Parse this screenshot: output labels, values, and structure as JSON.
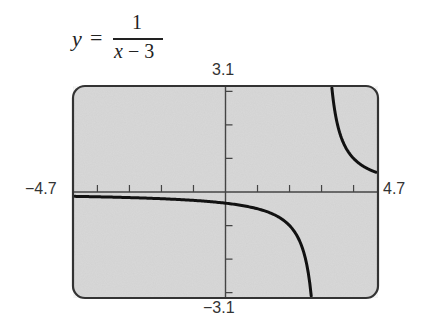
{
  "formula": {
    "lhs": "y",
    "equals": "=",
    "numerator": "1",
    "denominator_var": "x",
    "denominator_rest": " − 3"
  },
  "window": {
    "xmin_label": "−4.7",
    "xmax_label": "4.7",
    "ymin_label": "−3.1",
    "ymax_label": "3.1"
  },
  "colors": {
    "screen_bg": "#d9d9d9",
    "frame": "#333333",
    "axis": "#444444",
    "curve": "#111111"
  },
  "chart_data": {
    "type": "line",
    "function": "1/(x-3)",
    "xlabel": "",
    "ylabel": "",
    "xlim": [
      -4.7,
      4.7
    ],
    "ylim": [
      -3.1,
      3.1
    ],
    "xscale_tick": 1,
    "yscale_tick": 1,
    "x_ticks": [
      -4,
      -3,
      -2,
      -1,
      1,
      2,
      3,
      4
    ],
    "y_ticks": [
      -3,
      -2,
      -1,
      1,
      2,
      3
    ],
    "tick_labels": {
      "x": [
        "−4.7",
        "4.7"
      ],
      "y": [
        "−3.1",
        "3.1"
      ]
    },
    "grid": false,
    "legend": null,
    "vertical_asymptote": 3,
    "horizontal_asymptote": 0,
    "series": [
      {
        "name": "left branch (x < 3)",
        "x": [
          -4.7,
          -4,
          -3,
          -2,
          -1,
          0,
          1,
          2,
          2.5,
          2.68
        ],
        "y": [
          -0.13,
          -0.143,
          -0.167,
          -0.2,
          -0.25,
          -0.333,
          -0.5,
          -1,
          -2,
          -3.1
        ]
      },
      {
        "name": "right branch (x > 3)",
        "x": [
          3.32,
          3.5,
          4,
          4.5,
          4.7
        ],
        "y": [
          3.1,
          2,
          1,
          0.667,
          0.588
        ]
      }
    ]
  }
}
